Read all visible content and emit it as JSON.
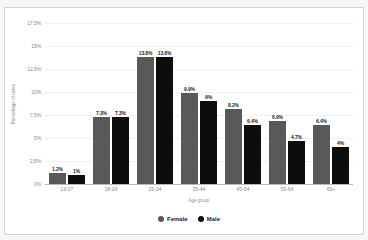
{
  "chart_data": {
    "type": "bar",
    "title": "",
    "xlabel": "Age group",
    "ylabel": "Percentage of users",
    "categories": [
      "13-17",
      "18-24",
      "25-34",
      "35-44",
      "45-54",
      "55-64",
      "65+"
    ],
    "series": [
      {
        "name": "Female",
        "color": "#595959",
        "values": [
          1.2,
          7.3,
          13.8,
          9.9,
          8.2,
          6.9,
          6.4
        ],
        "labels": [
          "1.2%",
          "7.3%",
          "13.8%",
          "9.9%",
          "8.2%",
          "6.9%",
          "6.4%"
        ]
      },
      {
        "name": "Male",
        "color": "#0d0d0d",
        "values": [
          1.0,
          7.3,
          13.8,
          9.0,
          6.4,
          4.7,
          4.0
        ],
        "labels": [
          "1%",
          "7.3%",
          "13.8%",
          "9%",
          "6.4%",
          "4.7%",
          "4%"
        ]
      }
    ],
    "ylim": [
      0,
      17.5
    ],
    "yticks": [
      0,
      2.5,
      5,
      7.5,
      10,
      12.5,
      15,
      17.5
    ],
    "ytick_labels": [
      "0%",
      "2.5%",
      "5%",
      "7.5%",
      "10%",
      "12.5%",
      "15%",
      "17.5%"
    ],
    "grid": true,
    "legend_position": "bottom"
  },
  "legend": {
    "items": [
      {
        "label": "Female",
        "marker": "circle-marker-female"
      },
      {
        "label": "Male",
        "marker": "circle-marker-male"
      }
    ]
  }
}
